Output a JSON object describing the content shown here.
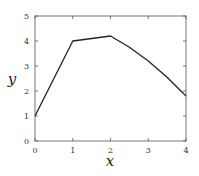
{
  "chart_data": {
    "type": "line",
    "title": "",
    "xlabel": "x",
    "ylabel": "y",
    "xlim": [
      0,
      4
    ],
    "ylim": [
      0,
      5
    ],
    "x_ticks": [
      "0",
      "1",
      "2",
      "3",
      "4"
    ],
    "y_ticks": [
      "0",
      "1",
      "2",
      "3",
      "4",
      "5"
    ],
    "grid": false,
    "legend": null,
    "series": [
      {
        "name": "y",
        "x": [
          0,
          1,
          2,
          2.5,
          3,
          3.5,
          4
        ],
        "values": [
          1.0,
          4.0,
          4.2,
          3.75,
          3.2,
          2.55,
          1.8
        ],
        "color": "#222222"
      }
    ]
  }
}
